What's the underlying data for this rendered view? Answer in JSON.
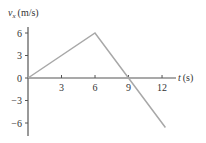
{
  "chart_data": {
    "type": "line",
    "title": "",
    "xlabel": "t (s)",
    "ylabel": "vx (m/s)",
    "ylabel_parts": {
      "symbol": "v",
      "subscript": "x",
      "unit": "(m/s)"
    },
    "xlabel_parts": {
      "symbol": "t",
      "unit": "(s)"
    },
    "x": [
      0,
      6,
      9,
      12.3
    ],
    "series": [
      {
        "name": "vx",
        "values": [
          0,
          6,
          0,
          -6.6
        ]
      }
    ],
    "xticks": [
      3,
      6,
      9,
      12
    ],
    "xtick_labels": [
      "3",
      "6",
      "9",
      "12"
    ],
    "yticks": [
      6,
      3,
      0,
      -3,
      -6
    ],
    "ytick_labels": [
      "6",
      "3",
      "0",
      "−3",
      "−6"
    ],
    "xlim": [
      0,
      13
    ],
    "ylim": [
      -7.5,
      7
    ],
    "grid": false,
    "legend": "none"
  },
  "colors": {
    "axis": "#555555",
    "line": "#a8a8a8",
    "text": "#333333"
  }
}
